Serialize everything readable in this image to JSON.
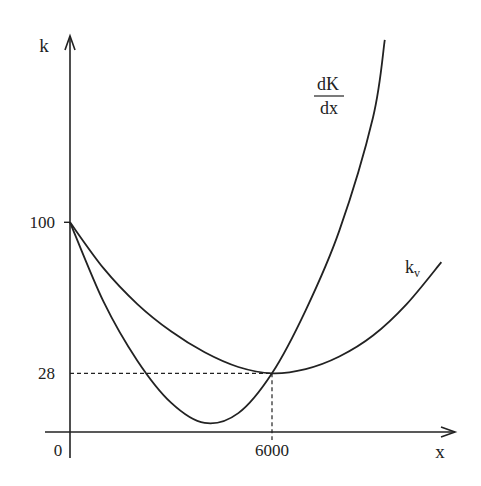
{
  "chart_data": {
    "type": "line",
    "title": "",
    "xlabel": "x",
    "ylabel": "k",
    "xlim": [
      0,
      11400
    ],
    "ylim": [
      0,
      100
    ],
    "grid": false,
    "xticks": [
      {
        "value": 0,
        "label": "0"
      },
      {
        "value": 6000,
        "label": "6000"
      }
    ],
    "yticks": [
      {
        "value": 100,
        "label": "100"
      },
      {
        "value": 28,
        "label": "28"
      }
    ],
    "series": [
      {
        "name": "dK/dx",
        "label_num": "dK",
        "label_den": "dx",
        "x": [
          0,
          1000,
          2000,
          3000,
          4000,
          5000,
          6000,
          7000,
          8000,
          9000,
          9350
        ],
        "y": [
          100,
          62,
          34,
          14,
          4.3,
          9,
          28,
          58,
          96,
          150,
          187
        ]
      },
      {
        "name": "k_v",
        "label_main": "k",
        "label_sub": "v",
        "x": [
          0,
          1000,
          2000,
          3000,
          4000,
          5000,
          6000,
          7000,
          8000,
          9000,
          10000,
          11030
        ],
        "y": [
          100,
          78,
          61,
          48,
          38,
          31,
          28,
          30,
          36,
          46,
          61,
          81
        ]
      }
    ],
    "annotations": [
      {
        "type": "dashed-guide",
        "text": "intersection",
        "x": 6000,
        "y": 28
      }
    ]
  }
}
